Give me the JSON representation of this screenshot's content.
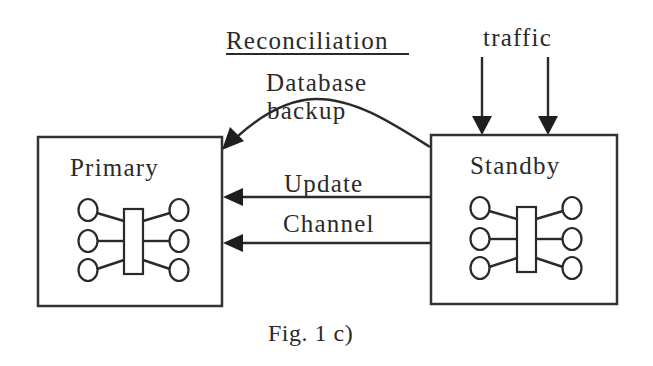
{
  "diagram": {
    "type": "replication-architecture",
    "nodes": [
      {
        "id": "primary",
        "label": "Primary"
      },
      {
        "id": "standby",
        "label": "Standby"
      }
    ],
    "edges": [
      {
        "from": "standby",
        "to": "primary",
        "label_line1": "Database",
        "label_line2": "backup",
        "style": "curved"
      },
      {
        "from": "standby",
        "to": "primary",
        "label": "Update",
        "style": "straight"
      },
      {
        "from": "standby",
        "to": "primary",
        "label": "Channel",
        "style": "straight"
      }
    ],
    "inputs": [
      {
        "to": "standby",
        "label": "traffic",
        "count": 2
      }
    ],
    "section_title": "Reconciliation",
    "caption": "Fig. 1 c)",
    "colors": {
      "ink": "#2a2a2a",
      "background": "#ffffff"
    }
  }
}
